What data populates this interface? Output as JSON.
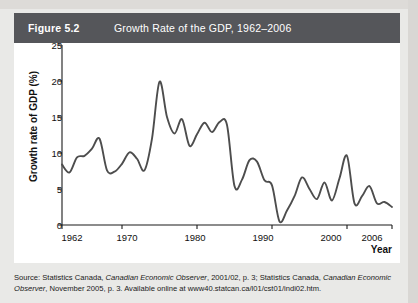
{
  "figure": {
    "label": "Figure 5.2",
    "title": "Growth Rate of the GDP, 1962–2006",
    "header_bg": "#55565a",
    "panel_bg": "#ffffff",
    "page_bg": "#e9e9e7"
  },
  "source": {
    "prefix": "Source: Statistics Canada, ",
    "pub1": "Canadian Economic Observer",
    "mid1": ", 2001/02, p. 3; Statistics Canada, ",
    "pub2": "Canadian Economic Observer",
    "mid2": ", November 2005, p. 3. Available online at ",
    "url": "www40.statcan.ca/l01/cst01/indi02.htm",
    "suffix": "."
  },
  "chart_data": {
    "type": "line",
    "title": "Growth Rate of the GDP, 1962–2006",
    "xlabel": "Year",
    "ylabel": "Growth rate of GDP (%)",
    "xlim": [
      1962,
      2006
    ],
    "ylim": [
      0,
      25
    ],
    "yticks": [
      0,
      5,
      10,
      15,
      20,
      25
    ],
    "xticks": [
      1962,
      1970,
      1980,
      1990,
      2000,
      2006
    ],
    "ytick_labels": [
      "0",
      "5",
      "10",
      "15",
      "20",
      "25"
    ],
    "xtick_labels": [
      "1962",
      "1970",
      "1980",
      "1990",
      "2000",
      "2006"
    ],
    "grid": false,
    "legend": "none",
    "line_color": "#4d4d4d",
    "series": [
      {
        "name": "Growth rate of GDP (%)",
        "x": [
          1962,
          1963,
          1964,
          1965,
          1966,
          1967,
          1968,
          1969,
          1970,
          1971,
          1972,
          1973,
          1974,
          1975,
          1976,
          1977,
          1978,
          1979,
          1980,
          1981,
          1982,
          1983,
          1984,
          1985,
          1986,
          1987,
          1988,
          1989,
          1990,
          1991,
          1992,
          1993,
          1994,
          1995,
          1996,
          1997,
          1998,
          1999,
          2000,
          2001,
          2002,
          2003,
          2004,
          2005,
          2006
        ],
        "values": [
          8.4,
          7.3,
          9.4,
          9.6,
          10.6,
          12.0,
          7.6,
          7.4,
          8.5,
          10.1,
          9.2,
          7.6,
          12.0,
          19.9,
          15.0,
          12.7,
          14.7,
          11.0,
          12.6,
          14.2,
          12.9,
          14.3,
          13.9,
          5.4,
          6.3,
          9.0,
          8.8,
          6.2,
          5.5,
          0.5,
          2.0,
          4.0,
          6.6,
          5.0,
          3.6,
          5.9,
          3.4,
          6.5,
          9.6,
          3.0,
          4.0,
          5.4,
          3.0,
          3.2,
          2.5
        ]
      }
    ]
  }
}
